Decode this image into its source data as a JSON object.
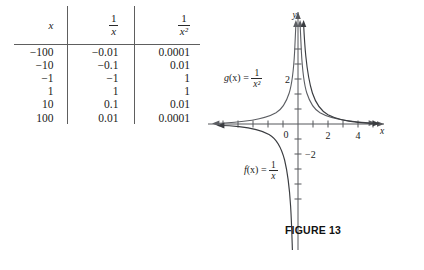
{
  "table": {
    "headers": [
      {
        "id": "col-x",
        "kind": "italic",
        "text": "x"
      },
      {
        "id": "col-inv-x",
        "kind": "fraction",
        "num": "1",
        "den": "x"
      },
      {
        "id": "col-inv-x2",
        "kind": "fraction",
        "num": "1",
        "den": "x²"
      }
    ],
    "rows": [
      {
        "x": "−100",
        "inv_x": "−0.01",
        "inv_x2": "0.0001"
      },
      {
        "x": "−10",
        "inv_x": "−0.1",
        "inv_x2": "0.01"
      },
      {
        "x": "−1",
        "inv_x": "−1",
        "inv_x2": "1"
      },
      {
        "x": "1",
        "inv_x": "1",
        "inv_x2": "1"
      },
      {
        "x": "10",
        "inv_x": "0.1",
        "inv_x2": "0.01"
      },
      {
        "x": "100",
        "inv_x": "0.01",
        "inv_x2": "0.0001"
      }
    ]
  },
  "graph": {
    "axis_label_x": "x",
    "axis_label_y": "y",
    "origin_label": "0",
    "x_tick_labels": [
      {
        "value": 2,
        "text": "2"
      },
      {
        "value": 4,
        "text": "4"
      }
    ],
    "y_tick_labels": [
      {
        "value": 2,
        "text": "2"
      },
      {
        "value": -2,
        "text": "−2"
      }
    ],
    "curve_labels": {
      "g": {
        "name": "g",
        "arg": "(x)",
        "eq": "=",
        "num": "1",
        "den": "x²"
      },
      "f": {
        "name": "f",
        "arg": "(x)",
        "eq": "=",
        "num": "1",
        "den": "x"
      }
    }
  },
  "caption": {
    "text": "FIGURE 13"
  },
  "chart_data": {
    "type": "line",
    "title": "FIGURE 13",
    "xlabel": "x",
    "ylabel": "y",
    "xlim": [
      -5.8,
      5.2
    ],
    "ylim": [
      -4.2,
      5.0
    ],
    "grid": false,
    "legend": "inline-annotations",
    "x_ticks": [
      -5,
      -4,
      -3,
      -2,
      -1,
      1,
      2,
      3,
      4,
      5
    ],
    "x_tick_labels_shown": [
      "2",
      "4"
    ],
    "y_ticks": [
      -4,
      -3,
      -2,
      -1,
      1,
      2,
      3,
      4
    ],
    "y_tick_labels_shown": [
      "2",
      "-2"
    ],
    "series": [
      {
        "name": "f(x) = 1/x",
        "expression": "1/x",
        "annotation": "f(x) = 1/x",
        "branches": [
          {
            "x": [
              -5.6,
              -5.0,
              -4.0,
              -3.0,
              -2.5,
              -2.0,
              -1.6,
              -1.3,
              -1.0,
              -0.8,
              -0.6,
              -0.45,
              -0.32,
              -0.24
            ],
            "y": [
              -0.179,
              -0.2,
              -0.25,
              -0.333,
              -0.4,
              -0.5,
              -0.625,
              -0.769,
              -1.0,
              -1.25,
              -1.667,
              -2.222,
              -3.125,
              -4.167
            ]
          },
          {
            "x": [
              0.24,
              0.32,
              0.45,
              0.6,
              0.8,
              1.0,
              1.3,
              1.6,
              2.0,
              2.5,
              3.0,
              4.0,
              5.0
            ],
            "y": [
              4.167,
              3.125,
              2.222,
              1.667,
              1.25,
              1.0,
              0.769,
              0.625,
              0.5,
              0.4,
              0.333,
              0.25,
              0.2
            ]
          }
        ]
      },
      {
        "name": "g(x) = 1/x^2",
        "expression": "1/x^2",
        "annotation": "g(x) = 1/x²",
        "branches": [
          {
            "x": [
              -5.6,
              -5.0,
              -4.0,
              -3.0,
              -2.5,
              -2.0,
              -1.6,
              -1.3,
              -1.0,
              -0.85,
              -0.7,
              -0.6,
              -0.5,
              -0.45
            ],
            "y": [
              0.032,
              0.04,
              0.0625,
              0.111,
              0.16,
              0.25,
              0.391,
              0.592,
              1.0,
              1.384,
              2.041,
              2.778,
              4.0,
              4.938
            ]
          },
          {
            "x": [
              0.45,
              0.5,
              0.6,
              0.7,
              0.85,
              1.0,
              1.3,
              1.6,
              2.0,
              2.5,
              3.0,
              4.0,
              5.0
            ],
            "y": [
              4.938,
              4.0,
              2.778,
              2.041,
              1.384,
              1.0,
              0.592,
              0.391,
              0.25,
              0.16,
              0.111,
              0.0625,
              0.04
            ]
          }
        ]
      }
    ],
    "table_reference": {
      "columns": [
        "x",
        "1/x",
        "1/x^2"
      ],
      "rows": [
        [
          -100,
          -0.01,
          0.0001
        ],
        [
          -10,
          -0.1,
          0.01
        ],
        [
          -1,
          -1,
          1
        ],
        [
          1,
          1,
          1
        ],
        [
          10,
          0.1,
          0.01
        ],
        [
          100,
          0.01,
          0.0001
        ]
      ]
    }
  }
}
